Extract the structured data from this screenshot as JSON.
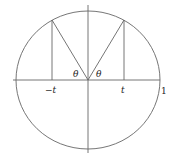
{
  "diagram": {
    "type": "unit-circle",
    "labels": {
      "neg_t": "−t",
      "pos_t": "t",
      "one": "1",
      "theta_left": "θ",
      "theta_right": "θ"
    },
    "colors": {
      "stroke": "#666666",
      "text": "#222222"
    }
  }
}
